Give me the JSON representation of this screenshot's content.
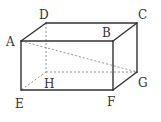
{
  "figure": {
    "type": "rectangular-prism",
    "vertices": {
      "A": {
        "x": 21,
        "y": 41
      },
      "B": {
        "x": 113,
        "y": 41
      },
      "C": {
        "x": 137,
        "y": 23
      },
      "D": {
        "x": 46,
        "y": 23
      },
      "E": {
        "x": 21,
        "y": 90
      },
      "F": {
        "x": 113,
        "y": 90
      },
      "G": {
        "x": 137,
        "y": 72
      },
      "H": {
        "x": 46,
        "y": 72
      }
    },
    "labels": [
      {
        "id": "A",
        "text": "A",
        "x": 6,
        "y": 46
      },
      {
        "id": "B",
        "text": "B",
        "x": 102,
        "y": 37
      },
      {
        "id": "C",
        "text": "C",
        "x": 138,
        "y": 19
      },
      {
        "id": "D",
        "text": "D",
        "x": 39,
        "y": 19
      },
      {
        "id": "E",
        "text": "E",
        "x": 15,
        "y": 108
      },
      {
        "id": "F",
        "text": "F",
        "x": 107,
        "y": 106
      },
      {
        "id": "G",
        "text": "G",
        "x": 138,
        "y": 87
      },
      {
        "id": "H",
        "text": "H",
        "x": 44,
        "y": 88
      }
    ],
    "solid_edges": [
      "AB",
      "BF",
      "FE",
      "EA",
      "AD",
      "DC",
      "CB",
      "CG",
      "GF"
    ],
    "hidden_edges": [
      "DH",
      "HE",
      "HG"
    ],
    "diagonal": {
      "from": "A",
      "to": "G",
      "style": "dashed"
    }
  }
}
